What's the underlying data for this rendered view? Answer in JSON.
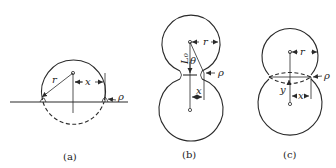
{
  "diagram": {
    "panels": [
      {
        "id": "a",
        "caption": "(a)",
        "description": "Sphere resting on a flat plane with contact neck",
        "labels": {
          "radius": "r",
          "neck": "x",
          "neck_radius": "ρ"
        }
      },
      {
        "id": "b",
        "caption": "(b)",
        "description": "Two spheres in contact forming a neck",
        "labels": {
          "radius": "r",
          "neck": "x",
          "neck_radius": "ρ",
          "center_distance": "L₀",
          "angle": "θ"
        }
      },
      {
        "id": "c",
        "caption": "(c)",
        "description": "Two overlapping spheres with center approach",
        "labels": {
          "radius": "r",
          "neck": "x",
          "neck_radius": "ρ",
          "shrinkage": "y"
        }
      }
    ],
    "colors": {
      "line": "#2a2a2a",
      "background": "#ffffff"
    }
  }
}
